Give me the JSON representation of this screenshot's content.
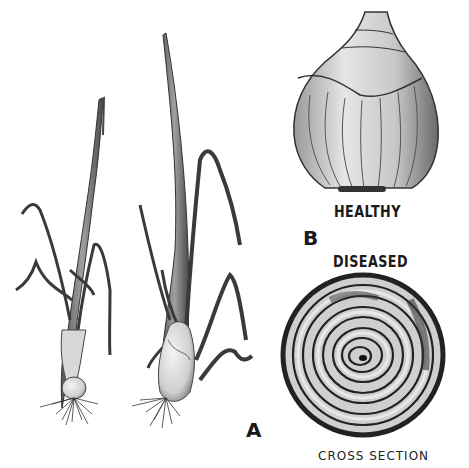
{
  "figure": {
    "panels": [
      {
        "id": "A",
        "label": "A",
        "content": "two young onion plants with leaves, bulbs and roots"
      },
      {
        "id": "B",
        "label": "B",
        "content": "onion bulbs: healthy whole bulb and diseased cross section"
      }
    ],
    "labels": {
      "healthy": "HEALTHY",
      "diseased": "DISEASED",
      "panel_b": "B",
      "panel_a": "A",
      "cross_section": "CROSS SECTION"
    },
    "colors": {
      "background": "#ffffff",
      "ink": "#1a1a1a",
      "mid_gray": "#8a8a8a",
      "light_gray": "#c8c8c8"
    }
  }
}
